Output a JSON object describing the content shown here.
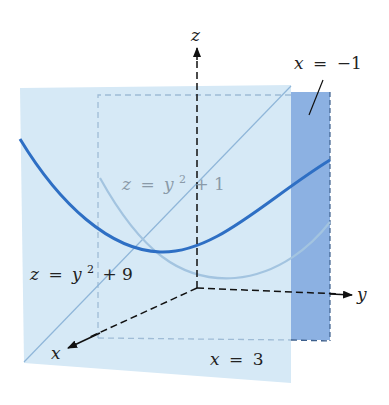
{
  "figure": {
    "axes": {
      "z_label": "z",
      "y_label": "y",
      "x_label": "x"
    },
    "planes": [
      {
        "name": "back-plane",
        "label": "x = −1",
        "lhs": "x",
        "rhs": "−1",
        "color": "#7fa8df"
      },
      {
        "name": "front-plane",
        "label": "x = 3",
        "lhs": "x",
        "rhs": "3",
        "color": "#d4e8f5"
      }
    ],
    "curves": [
      {
        "name": "trace-on-back-plane",
        "label": "z = y² + 1",
        "lhs": "z",
        "base": "y",
        "exp": "2",
        "tail": "+ 1",
        "color": "#9cc0de"
      },
      {
        "name": "trace-on-front-plane",
        "label": "z = y² + 9",
        "lhs": "z",
        "base": "y",
        "exp": "2",
        "tail": "+ 9",
        "color": "#2e6fc4"
      }
    ],
    "labels": {
      "eq_sign": "=",
      "back_plane_lhs": "x",
      "back_plane_rhs": "−1",
      "front_plane_lhs": "x",
      "front_plane_rhs": "3",
      "curve1_lhs": "z",
      "curve1_base": "y",
      "curve1_exp": "2",
      "curve1_tail": "+ 1",
      "curve9_lhs": "z",
      "curve9_base": "y",
      "curve9_exp": "2",
      "curve9_tail": "+ 9"
    }
  }
}
